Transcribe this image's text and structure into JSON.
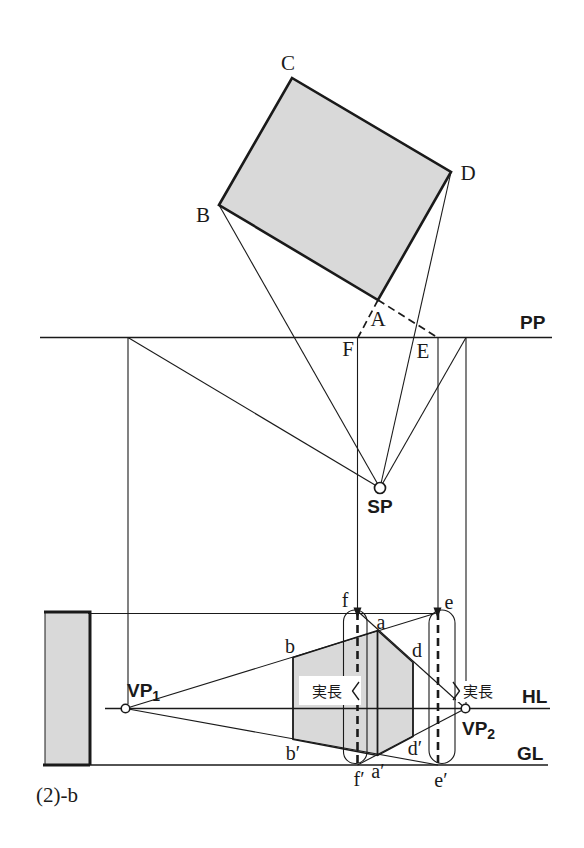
{
  "colors": {
    "ink": "#1a1a1a",
    "shade": "#d9d9d9",
    "background": "#ffffff"
  },
  "plan_view": {
    "corner_b": "B",
    "corner_c": "C",
    "corner_d": "D",
    "corner_a": "A",
    "point_f": "F",
    "point_e": "E",
    "picture_plane_label": "PP"
  },
  "station_point": {
    "label": "SP"
  },
  "perspective_view": {
    "horizon_label": "HL",
    "ground_label": "GL",
    "vp1": {
      "base": "VP",
      "sub": "1"
    },
    "vp2": {
      "base": "VP",
      "sub": "2"
    },
    "true_length_left": "実長",
    "true_length_right": "実長",
    "point_f": "f",
    "point_e": "e",
    "point_a": "a",
    "point_b": "b",
    "point_d": "d",
    "point_f_prime": "f′",
    "point_a_prime": "a′",
    "point_e_prime": "e′",
    "point_b_prime": "b′",
    "point_d_prime": "d′"
  },
  "caption": "(2)-b"
}
